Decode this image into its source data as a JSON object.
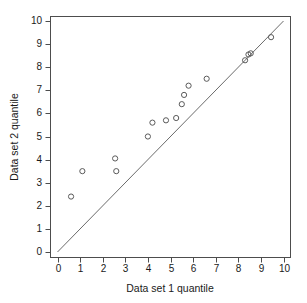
{
  "chart_data": {
    "type": "scatter",
    "title": "",
    "xlabel": "Data set 1 quantile",
    "ylabel": "Data set 2 quantile",
    "xlim": [
      0,
      10
    ],
    "ylim": [
      0,
      10
    ],
    "xticks": [
      "0",
      "1",
      "2",
      "3",
      "4",
      "5",
      "6",
      "7",
      "8",
      "9",
      "10"
    ],
    "yticks": [
      "0",
      "1",
      "2",
      "3",
      "4",
      "5",
      "6",
      "7",
      "8",
      "9",
      "10"
    ],
    "grid": false,
    "legend": null,
    "marker": "open-circle",
    "marker_color": "#5a5a5a",
    "reference_line": {
      "name": "identity-line",
      "type": "line",
      "slope": 1,
      "intercept": 0,
      "x": [
        0,
        10
      ],
      "y": [
        0,
        10
      ],
      "color": "#6b6b6b"
    },
    "series": [
      {
        "name": "quantile-pairs",
        "points": [
          [
            0.6,
            2.4
          ],
          [
            1.1,
            3.5
          ],
          [
            2.55,
            4.05
          ],
          [
            2.6,
            3.5
          ],
          [
            4.0,
            5.0
          ],
          [
            4.2,
            5.6
          ],
          [
            4.8,
            5.7
          ],
          [
            5.25,
            5.8
          ],
          [
            5.5,
            6.4
          ],
          [
            5.6,
            6.8
          ],
          [
            5.8,
            7.2
          ],
          [
            6.6,
            7.5
          ],
          [
            8.3,
            8.3
          ],
          [
            8.45,
            8.55
          ],
          [
            8.55,
            8.6
          ],
          [
            9.45,
            9.3
          ]
        ]
      }
    ]
  },
  "axes": {
    "x_title": "Data set 1 quantile",
    "y_title": "Data set 2 quantile"
  }
}
